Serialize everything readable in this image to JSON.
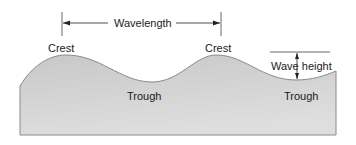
{
  "diagram": {
    "labels": {
      "wavelength": "Wavelength",
      "crest_left": "Crest",
      "crest_right": "Crest",
      "trough_left": "Trough",
      "trough_right": "Trough",
      "wave_height": "Wave height"
    },
    "colors": {
      "water_fill_top": "#c9c9c9",
      "water_fill_bottom": "#dcdcdc",
      "outline": "#8a8a8a",
      "line": "#222222",
      "text": "#1a1a1a"
    }
  }
}
